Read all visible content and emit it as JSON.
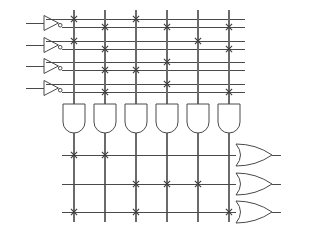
{
  "diagram": {
    "type": "pla-programmable-logic-array",
    "inputs": [
      {
        "label": "I1"
      },
      {
        "label": "I2"
      },
      {
        "label": "I3"
      },
      {
        "label": "I4"
      }
    ],
    "product_terms": [
      {
        "label": "P1"
      },
      {
        "label": "P2"
      },
      {
        "label": "P3"
      },
      {
        "label": "P4"
      },
      {
        "label": "P5"
      },
      {
        "label": "P6"
      }
    ],
    "outputs": [
      {
        "label": "O1"
      },
      {
        "label": "O2"
      },
      {
        "label": "O3"
      }
    ],
    "and_plane_rows": [
      {
        "signal": "I1",
        "polarity": "true",
        "connections": [
          "P1",
          "P3"
        ]
      },
      {
        "signal": "I1",
        "polarity": "complement",
        "connections": [
          "P2",
          "P4",
          "P6"
        ]
      },
      {
        "signal": "I2",
        "polarity": "true",
        "connections": [
          "P1",
          "P5"
        ]
      },
      {
        "signal": "I2",
        "polarity": "complement",
        "connections": [
          "P2",
          "P6"
        ]
      },
      {
        "signal": "I3",
        "polarity": "true",
        "connections": [
          "P4"
        ]
      },
      {
        "signal": "I3",
        "polarity": "complement",
        "connections": [
          "P2",
          "P3"
        ]
      },
      {
        "signal": "I4",
        "polarity": "true",
        "connections": [
          "P4"
        ]
      },
      {
        "signal": "I4",
        "polarity": "complement",
        "connections": [
          "P2",
          "P6"
        ]
      }
    ],
    "or_plane_rows": [
      {
        "output": "O1",
        "connections": [
          "P1",
          "P2"
        ]
      },
      {
        "output": "O2",
        "connections": [
          "P3",
          "P4",
          "P5"
        ]
      },
      {
        "output": "O3",
        "connections": [
          "P1",
          "P3",
          "P6"
        ]
      }
    ],
    "colors": {
      "wire": "#4a4a4a",
      "vertical_wire": "#6b6b6b",
      "cross": "#3c3c3c",
      "text": "#1b1b1b",
      "background": "#ffffff"
    },
    "geometry": {
      "column_x": [
        74,
        105,
        136,
        167,
        198,
        229
      ],
      "and_row_y": [
        19,
        27,
        41,
        49,
        62,
        70,
        84,
        92
      ],
      "or_row_y": [
        155,
        184,
        212
      ],
      "input_label_x": 16,
      "inverter_left": 44,
      "inverter_right": 61,
      "row_right_x": 245,
      "vertical_top_y": 10,
      "and_gate_top_y": 104,
      "and_gate_bottom_y": 133,
      "gate_label_y": 143,
      "or_gate_left_x": 236,
      "or_gate_right_x": 272,
      "output_label_x": 285
    }
  }
}
